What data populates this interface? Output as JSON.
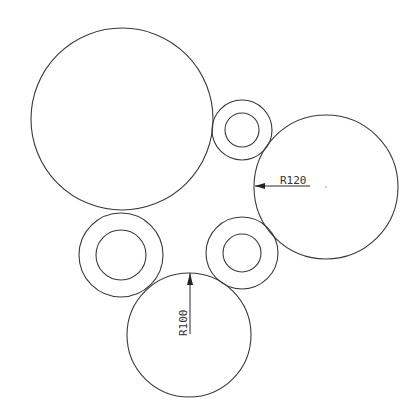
{
  "drawing": {
    "stroke_color": "#3a3a3a",
    "background": "#ffffff",
    "circles": [
      {
        "name": "large-circle-top-left",
        "cx": 122,
        "cy": 119,
        "r": 91
      },
      {
        "name": "right-circle",
        "cx": 326,
        "cy": 187,
        "r": 72
      },
      {
        "name": "bottom-circle",
        "cx": 189,
        "cy": 335,
        "r": 62
      }
    ],
    "rings": [
      {
        "name": "ring-top-middle",
        "cx": 242,
        "cy": 130,
        "r_outer": 30,
        "r_inner": 17
      },
      {
        "name": "ring-left-lower",
        "cx": 121,
        "cy": 255,
        "r_outer": 42,
        "r_inner": 25
      },
      {
        "name": "ring-right-lower",
        "cx": 242,
        "cy": 253,
        "r_outer": 36,
        "r_inner": 19
      }
    ],
    "dimensions": [
      {
        "name": "dimension-r120",
        "label": "R120",
        "target": "right-circle",
        "orientation": "horizontal"
      },
      {
        "name": "dimension-r100",
        "label": "R100",
        "target": "bottom-circle",
        "orientation": "vertical"
      }
    ]
  }
}
